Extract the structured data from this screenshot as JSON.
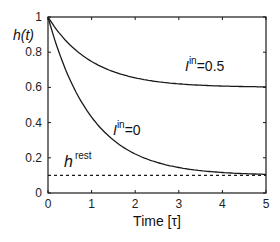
{
  "chart_data": {
    "type": "line",
    "title": "",
    "xlabel": "Time [τ]",
    "ylabel": "h(t)",
    "xlim": [
      0,
      5
    ],
    "ylim": [
      0,
      1
    ],
    "xticks": [
      "0",
      "1",
      "2",
      "3",
      "4",
      "5"
    ],
    "yticks": [
      "0",
      "0.2",
      "0.4",
      "0.6",
      "0.8",
      "1"
    ],
    "grid": false,
    "legend": "none (inline annotations)",
    "x": [
      0,
      0.25,
      0.5,
      0.75,
      1,
      1.5,
      2,
      2.5,
      3,
      3.5,
      4,
      4.5,
      5
    ],
    "series": [
      {
        "name": "I^in=0.5",
        "style": "solid",
        "values": [
          1.0,
          0.912,
          0.843,
          0.789,
          0.747,
          0.689,
          0.654,
          0.633,
          0.62,
          0.612,
          0.607,
          0.604,
          0.603
        ]
      },
      {
        "name": "I^in=0",
        "style": "solid",
        "values": [
          1.0,
          0.801,
          0.646,
          0.525,
          0.431,
          0.301,
          0.222,
          0.174,
          0.145,
          0.127,
          0.116,
          0.11,
          0.106
        ]
      },
      {
        "name": "h^rest",
        "style": "dashed",
        "values": [
          0.1,
          0.1,
          0.1,
          0.1,
          0.1,
          0.1,
          0.1,
          0.1,
          0.1,
          0.1,
          0.1,
          0.1,
          0.1
        ]
      }
    ],
    "annotations": [
      {
        "text": "I^in=0.5",
        "x": 3.0,
        "y": 0.72
      },
      {
        "text": "I^in=0",
        "x": 1.5,
        "y": 0.3
      },
      {
        "text": "h^rest",
        "x": 0.35,
        "y": 0.16
      }
    ]
  },
  "labels": {
    "ylabel_main": "h",
    "ylabel_paren": "(t)",
    "xlabel": "Time [τ]",
    "ann1_base": "I",
    "ann1_sup": "in",
    "ann1_val": "=0.5",
    "ann2_base": "I",
    "ann2_sup": "in",
    "ann2_val": "=0",
    "ann3_base": "h",
    "ann3_sup": "rest"
  },
  "colors": {
    "axis": "#1a1a1a",
    "curve": "#1a1a1a",
    "background": "#ffffff"
  }
}
